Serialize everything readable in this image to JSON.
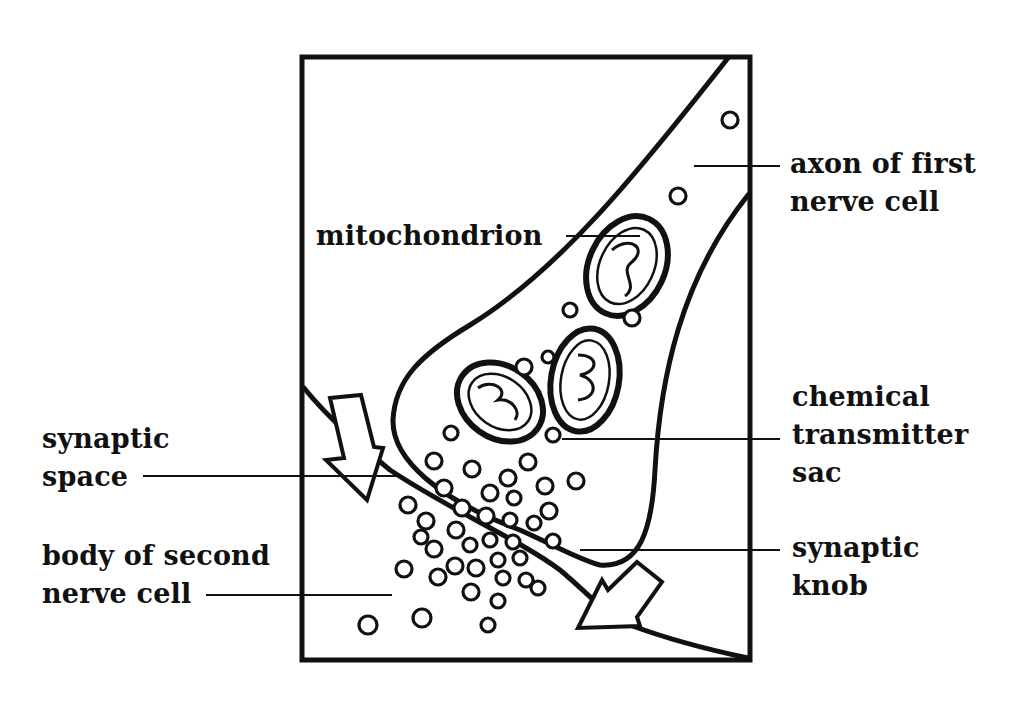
{
  "diagram": {
    "type": "labeled illustration",
    "labels": {
      "axon": [
        "axon of first",
        "nerve cell"
      ],
      "mitochondrion": [
        "mitochondrion"
      ],
      "chemical_transmitter_sac": [
        "chemical",
        "transmitter",
        "sac"
      ],
      "synaptic_space": [
        "synaptic",
        "space"
      ],
      "synaptic_knob": [
        "synaptic",
        "knob"
      ],
      "body_second_cell": [
        "body of second",
        "nerve cell"
      ]
    },
    "colors": {
      "ink": "#111111",
      "background": "#ffffff"
    }
  }
}
